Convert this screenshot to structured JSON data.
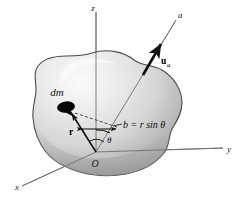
{
  "figure": {
    "background_color": "#ffffff"
  },
  "axes": {
    "z_label": "z",
    "y_label": "y",
    "x_label": "x",
    "a_label": "a",
    "origin_label": "O",
    "axis_color": "#6b6b6b"
  },
  "labels": {
    "mass_element": "dm",
    "position_vector": "r",
    "unit_vector": "u",
    "unit_vector_subscript": "a",
    "perpendicular_distance": "b = r sin θ",
    "angle": "θ"
  },
  "body": {
    "fill_light": "#f2f2f2",
    "fill_mid": "#d0d0d0",
    "fill_dark": "#9a9a9a",
    "outline_color": "#4d4d4d",
    "mass_blob_color": "#000000"
  }
}
